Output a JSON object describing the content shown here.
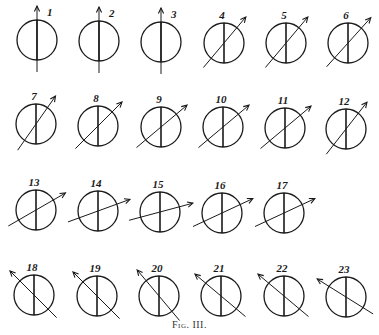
{
  "caption": "Fig. III.",
  "colors": {
    "ink": "#1a1a1a",
    "background": "#ffffff"
  },
  "figures": [
    {
      "label": "1",
      "cx": 37,
      "cy": 40,
      "angle": 90
    },
    {
      "label": "2",
      "cx": 99,
      "cy": 41,
      "angle": 90
    },
    {
      "label": "3",
      "cx": 161,
      "cy": 42,
      "angle": 90
    },
    {
      "label": "4",
      "cx": 224,
      "cy": 43,
      "angle": 50
    },
    {
      "label": "5",
      "cx": 286,
      "cy": 43,
      "angle": 50
    },
    {
      "label": "6",
      "cx": 348,
      "cy": 43,
      "angle": 48
    },
    {
      "label": "7",
      "cx": 36,
      "cy": 124,
      "angle": 55
    },
    {
      "label": "8",
      "cx": 98,
      "cy": 126,
      "angle": 45
    },
    {
      "label": "9",
      "cx": 161,
      "cy": 127,
      "angle": 40
    },
    {
      "label": "10",
      "cx": 223,
      "cy": 127,
      "angle": 40
    },
    {
      "label": "11",
      "cx": 285,
      "cy": 128,
      "angle": 40
    },
    {
      "label": "12",
      "cx": 346,
      "cy": 129,
      "angle": 52
    },
    {
      "label": "13",
      "cx": 36,
      "cy": 210,
      "angle": 30
    },
    {
      "label": "14",
      "cx": 98,
      "cy": 211,
      "angle": 20
    },
    {
      "label": "15",
      "cx": 160,
      "cy": 212,
      "angle": 15
    },
    {
      "label": "16",
      "cx": 222,
      "cy": 213,
      "angle": 25
    },
    {
      "label": "17",
      "cx": 284,
      "cy": 213,
      "angle": 25
    },
    {
      "label": "18",
      "cx": 34,
      "cy": 295,
      "angle": 135
    },
    {
      "label": "19",
      "cx": 97,
      "cy": 296,
      "angle": 135
    },
    {
      "label": "20",
      "cx": 159,
      "cy": 296,
      "angle": 130
    },
    {
      "label": "21",
      "cx": 221,
      "cy": 296,
      "angle": 140
    },
    {
      "label": "22",
      "cx": 284,
      "cy": 296,
      "angle": 140
    },
    {
      "label": "23",
      "cx": 346,
      "cy": 297,
      "angle": 148
    }
  ]
}
